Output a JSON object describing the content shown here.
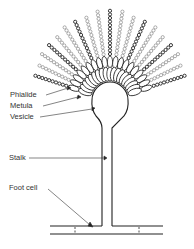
{
  "diagram": {
    "labels": {
      "phialide": "Phialide",
      "metula": "Metula",
      "vesicle": "Vesicle",
      "stalk": "Stalk",
      "foot_cell": "Foot cell"
    },
    "colors": {
      "line": "#222222",
      "background": "#ffffff",
      "label_text": "#333333"
    },
    "parts": [
      "spore-chains",
      "phialides",
      "metulae",
      "vesicle",
      "stalk",
      "foot-cell",
      "hypha"
    ]
  }
}
